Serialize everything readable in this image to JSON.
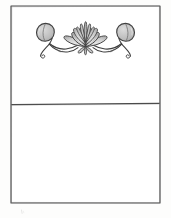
{
  "document": {
    "title": "Ornamental Frame Sketch",
    "medium": "pencil sketch",
    "background_color": "#fdfdfc",
    "canvas": {
      "width": 171,
      "height": 218
    }
  },
  "frame": {
    "name": "outer-rectangle-border",
    "stroke_color": "#4a4a4a",
    "fill_color": "#ffffff",
    "x": 11,
    "y": 6,
    "width": 149,
    "height": 197,
    "stroke_width": 1.1
  },
  "divider": {
    "name": "horizontal-divider-line",
    "stroke_color": "#4a4a4a",
    "y": 104,
    "x_start": 11,
    "x_end": 160,
    "stroke_width": 1.1
  },
  "panels": [
    {
      "name": "upper-panel",
      "contains_ornament": true,
      "height": 98
    },
    {
      "name": "lower-panel",
      "contains_ornament": false,
      "height": 99
    }
  ],
  "ornament": {
    "name": "lotus-flourish-ornament",
    "description": "Symmetrical lotus flower flanked by two buds on scrolling vine tendrils",
    "center_x": 85.5,
    "center_y": 38,
    "outline_color": "#3f3f3f",
    "petal_fill_light": "#dcdcdc",
    "petal_fill_mid": "#c2c2c2",
    "petal_fill_dark": "#a8a8a8",
    "vine_color": "#3f3f3f",
    "elements": [
      {
        "name": "lotus-flower-center",
        "type": "flower",
        "petal_rows": 3
      },
      {
        "name": "bud-left",
        "type": "bud",
        "cx": 45,
        "cy": 33
      },
      {
        "name": "bud-right",
        "type": "bud",
        "cx": 126,
        "cy": 33
      },
      {
        "name": "vine-left",
        "type": "scroll-tendril"
      },
      {
        "name": "vine-right",
        "type": "scroll-tendril"
      },
      {
        "name": "calyx-leaves",
        "type": "leaf-cluster"
      }
    ]
  },
  "artifacts": [
    {
      "name": "stray-pencil-mark",
      "x": 22,
      "y": 212,
      "opacity": 0.22
    }
  ]
}
